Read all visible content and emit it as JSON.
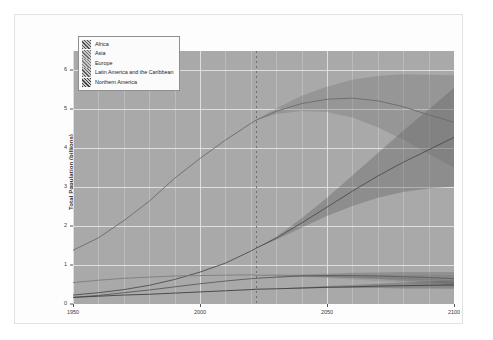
{
  "document": {
    "background_color": "#ffffff",
    "frame_border_color": "#e2e2e2"
  },
  "figure": {
    "panel_background": "#a9a9a9",
    "grid_color": "#e8e8e8",
    "projection_marker_year": 2022
  },
  "legend": {
    "position": "top-left",
    "items": [
      {
        "label": "Africa",
        "color": "#4d4d4d"
      },
      {
        "label": "Asia",
        "color": "#6b6b6b"
      },
      {
        "label": "Europe",
        "color": "#7d7d7d"
      },
      {
        "label": "Latin America and the Caribbean",
        "color": "#5a5a5a"
      },
      {
        "label": "Northern America",
        "color": "#3f3f3f"
      }
    ]
  },
  "chart_data": {
    "type": "line",
    "title": "",
    "subtitle": "",
    "xlabel": "",
    "ylabel": "Total Population (billions)",
    "xlim": [
      1950,
      2100
    ],
    "ylim": [
      0,
      6.5
    ],
    "xticks": [
      1950,
      2000,
      2050,
      2100
    ],
    "xtick_labels": [
      "1950",
      "2000",
      "2050",
      "2100"
    ],
    "yticks": [
      0,
      1,
      2,
      3,
      4,
      5,
      6
    ],
    "ytick_labels": [
      "0",
      "1",
      "2",
      "3",
      "4",
      "5",
      "6"
    ],
    "grid": true,
    "legend_position": "upper left",
    "bands": "95% prediction interval shading around each projected median",
    "x": [
      1950,
      1960,
      1970,
      1980,
      1990,
      2000,
      2010,
      2020,
      2022,
      2030,
      2040,
      2050,
      2060,
      2070,
      2080,
      2090,
      2100
    ],
    "series": [
      {
        "name": "Africa",
        "color": "#4d4d4d",
        "values": [
          0.23,
          0.29,
          0.37,
          0.48,
          0.63,
          0.82,
          1.05,
          1.36,
          1.43,
          1.69,
          2.08,
          2.49,
          2.9,
          3.29,
          3.64,
          3.96,
          4.28
        ],
        "band_low": [
          0.23,
          0.29,
          0.37,
          0.48,
          0.63,
          0.82,
          1.05,
          1.36,
          1.43,
          1.65,
          1.96,
          2.26,
          2.52,
          2.73,
          2.88,
          2.97,
          3.02
        ],
        "band_high": [
          0.23,
          0.29,
          0.37,
          0.48,
          0.63,
          0.82,
          1.05,
          1.36,
          1.43,
          1.73,
          2.2,
          2.73,
          3.3,
          3.88,
          4.45,
          5.0,
          5.55
        ]
      },
      {
        "name": "Asia",
        "color": "#6b6b6b",
        "values": [
          1.38,
          1.7,
          2.14,
          2.64,
          3.23,
          3.74,
          4.21,
          4.64,
          4.72,
          4.95,
          5.15,
          5.26,
          5.29,
          5.22,
          5.07,
          4.86,
          4.67
        ],
        "band_low": [
          1.38,
          1.7,
          2.14,
          2.64,
          3.23,
          3.74,
          4.21,
          4.64,
          4.72,
          4.88,
          4.96,
          4.93,
          4.79,
          4.54,
          4.22,
          3.86,
          3.5
        ],
        "band_high": [
          1.38,
          1.7,
          2.14,
          2.64,
          3.23,
          3.74,
          4.21,
          4.64,
          4.72,
          5.02,
          5.35,
          5.58,
          5.76,
          5.86,
          5.9,
          5.89,
          5.88
        ]
      },
      {
        "name": "Europe",
        "color": "#7d7d7d",
        "values": [
          0.55,
          0.61,
          0.66,
          0.69,
          0.72,
          0.73,
          0.74,
          0.75,
          0.74,
          0.74,
          0.73,
          0.71,
          0.69,
          0.67,
          0.65,
          0.63,
          0.59
        ],
        "band_low": [
          0.55,
          0.61,
          0.66,
          0.69,
          0.72,
          0.73,
          0.74,
          0.75,
          0.74,
          0.73,
          0.71,
          0.67,
          0.63,
          0.59,
          0.55,
          0.5,
          0.45
        ],
        "band_high": [
          0.55,
          0.61,
          0.66,
          0.69,
          0.72,
          0.73,
          0.74,
          0.75,
          0.74,
          0.75,
          0.76,
          0.75,
          0.75,
          0.75,
          0.75,
          0.75,
          0.74
        ]
      },
      {
        "name": "Latin America and the Caribbean",
        "color": "#5a5a5a",
        "values": [
          0.17,
          0.22,
          0.29,
          0.36,
          0.44,
          0.52,
          0.59,
          0.65,
          0.66,
          0.69,
          0.72,
          0.73,
          0.73,
          0.72,
          0.7,
          0.68,
          0.65
        ],
        "band_low": [
          0.17,
          0.22,
          0.29,
          0.36,
          0.44,
          0.52,
          0.59,
          0.65,
          0.66,
          0.68,
          0.7,
          0.69,
          0.67,
          0.64,
          0.6,
          0.56,
          0.51
        ],
        "band_high": [
          0.17,
          0.22,
          0.29,
          0.36,
          0.44,
          0.52,
          0.59,
          0.65,
          0.66,
          0.7,
          0.75,
          0.78,
          0.8,
          0.81,
          0.82,
          0.82,
          0.82
        ]
      },
      {
        "name": "Northern America",
        "color": "#3f3f3f",
        "values": [
          0.17,
          0.2,
          0.23,
          0.25,
          0.28,
          0.31,
          0.34,
          0.37,
          0.38,
          0.39,
          0.41,
          0.43,
          0.44,
          0.46,
          0.47,
          0.48,
          0.49
        ],
        "band_low": [
          0.17,
          0.2,
          0.23,
          0.25,
          0.28,
          0.31,
          0.34,
          0.37,
          0.38,
          0.39,
          0.4,
          0.41,
          0.41,
          0.41,
          0.4,
          0.4,
          0.39
        ],
        "band_high": [
          0.17,
          0.2,
          0.23,
          0.25,
          0.28,
          0.31,
          0.34,
          0.37,
          0.38,
          0.4,
          0.43,
          0.46,
          0.49,
          0.52,
          0.55,
          0.58,
          0.61
        ]
      }
    ]
  }
}
